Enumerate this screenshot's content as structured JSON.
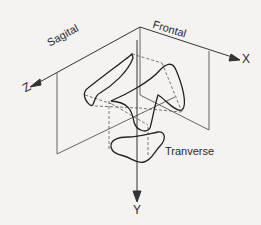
{
  "diagram": {
    "title": "",
    "planes": {
      "sagittal": "Sagital",
      "frontal": "Frontal",
      "transverse": "Tranverse"
    },
    "axes": {
      "x": "X",
      "y": "Y",
      "z": "Z"
    },
    "colors": {
      "background": "#f4f3f1",
      "line": "#2a2a2a",
      "plane_edge": "#555555"
    }
  }
}
